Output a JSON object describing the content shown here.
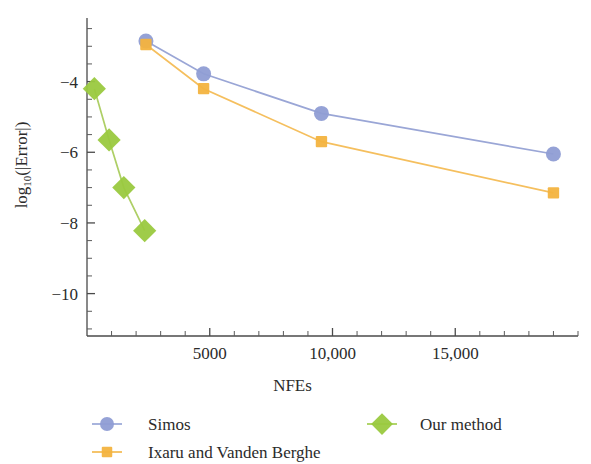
{
  "chart_data": {
    "type": "line",
    "title": "",
    "xlabel": "NFEs",
    "ylabel": "log10(|Error|)",
    "ylabel_base": "log",
    "ylabel_sub": "10",
    "ylabel_tail": "(|Error|)",
    "xlim": [
      0,
      20000
    ],
    "ylim": [
      -11.2,
      -2.2
    ],
    "grid": false,
    "legend_position": "bottom",
    "x_ticks_major": [
      5000,
      10000,
      15000
    ],
    "x_tick_labels": [
      "5000",
      "10,000",
      "15,000"
    ],
    "x_ticks_minor": [
      1000,
      2000,
      3000,
      4000,
      6000,
      7000,
      8000,
      9000,
      11000,
      12000,
      13000,
      14000,
      16000,
      17000,
      18000,
      19000,
      20000
    ],
    "y_ticks_major": [
      -4,
      -6,
      -8,
      -10
    ],
    "y_tick_labels": [
      "−4",
      "−6",
      "−8",
      "−10"
    ],
    "y_ticks_minor": [
      -2.5,
      -3,
      -3.5,
      -4.5,
      -5,
      -5.5,
      -6.5,
      -7,
      -7.5,
      -8.5,
      -9,
      -9.5,
      -10.5,
      -11
    ],
    "series": [
      {
        "name": "Simos",
        "marker": "circle",
        "color": "#8f9dd4",
        "line_color": "#9aa6d6",
        "x": [
          2400,
          4750,
          9550,
          19000
        ],
        "y": [
          -2.85,
          -3.78,
          -4.9,
          -6.05
        ]
      },
      {
        "name": "Ixaru and Vanden Berghe",
        "marker": "square",
        "color": "#f3b33f",
        "line_color": "#f5bf5e",
        "x": [
          2400,
          4750,
          9550,
          19000
        ],
        "y": [
          -2.95,
          -4.2,
          -5.7,
          -7.15
        ]
      },
      {
        "name": "Our method",
        "marker": "diamond",
        "color": "#9ac93f",
        "line_color": "#aecf66",
        "x": [
          300,
          900,
          1500,
          2350
        ],
        "y": [
          -4.2,
          -5.65,
          -7.0,
          -8.22
        ]
      }
    ]
  },
  "legend": {
    "entries": [
      {
        "label": "Simos",
        "marker": "circle",
        "color": "#8f9dd4"
      },
      {
        "label": "Ixaru and Vanden Berghe",
        "marker": "square",
        "color": "#f3b33f"
      },
      {
        "label": "Our method",
        "marker": "diamond",
        "color": "#9ac93f"
      }
    ]
  }
}
